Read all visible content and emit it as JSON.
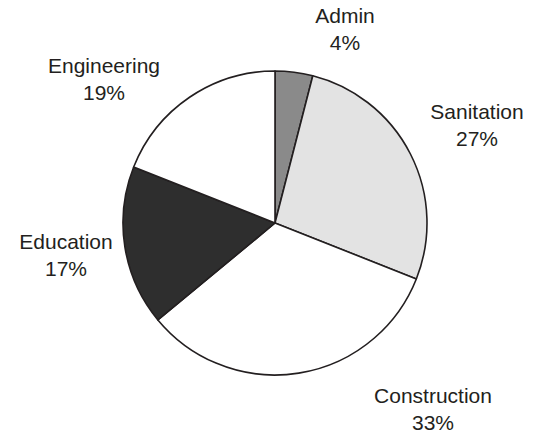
{
  "chart_data": {
    "type": "pie",
    "title": "",
    "xlabel": "",
    "ylabel": "",
    "categories": [
      "Admin",
      "Sanitation",
      "Construction",
      "Education",
      "Engineering"
    ],
    "values": [
      4,
      27,
      33,
      17,
      19
    ],
    "value_unit": "%",
    "legend": "none",
    "labels_position": "outside",
    "start_angle_deg": 0,
    "direction": "clockwise",
    "grid": false,
    "slices": [
      {
        "name": "Admin",
        "value": 4,
        "value_label": "4%",
        "color": "#8a8a8a"
      },
      {
        "name": "Sanitation",
        "value": 27,
        "value_label": "27%",
        "color": "#e3e3e3"
      },
      {
        "name": "Construction",
        "value": 33,
        "value_label": "33%",
        "color": "#ffffff"
      },
      {
        "name": "Education",
        "value": 17,
        "value_label": "17%",
        "color": "#2e2e2e"
      },
      {
        "name": "Engineering",
        "value": 19,
        "value_label": "19%",
        "color": "#ffffff"
      }
    ]
  },
  "chart": {
    "title_fragment": "",
    "outline_color": "#231f20",
    "center_x": 275,
    "center_y": 223,
    "radius": 152
  },
  "labels": {
    "admin": {
      "name": "Admin",
      "value": "4%"
    },
    "sanitation": {
      "name": "Sanitation",
      "value": "27%"
    },
    "construction": {
      "name": "Construction",
      "value": "33%"
    },
    "education": {
      "name": "Education",
      "value": "17%"
    },
    "engineering": {
      "name": "Engineering",
      "value": "19%"
    }
  }
}
